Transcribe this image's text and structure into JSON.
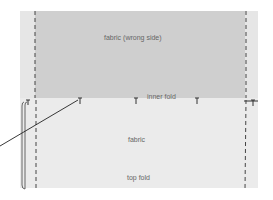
{
  "diagram": {
    "labels": {
      "wrong_side": "fabric (wrong side)",
      "inner_fold": "inner fold",
      "fabric": "fabric",
      "top_fold": "top fold"
    },
    "colors": {
      "wrong_side": "#cfcfcf",
      "fabric": "#ebebeb",
      "edge_strip": "#e6e6e6",
      "line": "#333333"
    },
    "pins": 6
  }
}
